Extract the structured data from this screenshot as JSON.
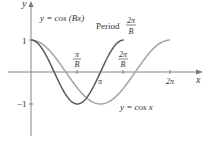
{
  "chart_data": {
    "type": "line",
    "title": "",
    "xlabel": "x",
    "ylabel": "y",
    "ylim": [
      -1,
      1
    ],
    "xlim": [
      0,
      6.2832
    ],
    "grid": false,
    "x_ticks": [
      {
        "value": "pi/B",
        "label_num": "π",
        "label_den": "B"
      },
      {
        "value": "pi",
        "label": "π"
      },
      {
        "value": "2pi/B",
        "label_num": "2π",
        "label_den": "B"
      },
      {
        "value": "2pi",
        "label": "2π"
      }
    ],
    "y_ticks": [
      {
        "value": 1,
        "label": "1"
      },
      {
        "value": -1,
        "label": "−1"
      }
    ],
    "series": [
      {
        "name": "y = cos(Bx)",
        "function": "cos(Bx)",
        "B": 1.5,
        "period": "2π/B",
        "color": "#555555",
        "x_range": [
          0,
          4.18879
        ]
      },
      {
        "name": "y = cos x",
        "function": "cos(x)",
        "period": "2π",
        "color": "#a0a0a0",
        "x_range": [
          0,
          6.28319
        ]
      }
    ],
    "annotations": [
      {
        "text": "y = cos (Bx)",
        "target": "cos(Bx) curve"
      },
      {
        "text": "Period",
        "fraction_num": "2π",
        "fraction_den": "B"
      },
      {
        "text": "y = cos x",
        "target": "cos x curve"
      }
    ]
  },
  "labels": {
    "y_axis": "y",
    "x_axis": "x",
    "y_one": "1",
    "y_neg_one": "−1",
    "tick_pi_over_b_num": "π",
    "tick_pi_over_b_den": "B",
    "tick_2pi_over_b_num": "2π",
    "tick_2pi_over_b_den": "B",
    "tick_pi": "π",
    "tick_2pi": "2π",
    "cosbx_label": "y = cos (Bx)",
    "period_label": "Period",
    "period_num": "2π",
    "period_den": "B",
    "cosx_label": "y = cos x"
  }
}
